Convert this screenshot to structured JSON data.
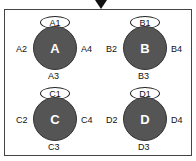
{
  "diagram": {
    "arrow": {
      "direction": "down",
      "color": "#111111"
    },
    "frame_color": "#444444",
    "circle_fill": "#555555",
    "nodes": [
      {
        "id": "A",
        "label": "A",
        "top": "A1",
        "left": "A2",
        "bottom": "A3",
        "right": "A4"
      },
      {
        "id": "B",
        "label": "B",
        "top": "B1",
        "left": "B2",
        "bottom": "B3",
        "right": "B4"
      },
      {
        "id": "C",
        "label": "C",
        "top": "C1",
        "left": "C2",
        "bottom": "C3",
        "right": "C4"
      },
      {
        "id": "D",
        "label": "D",
        "top": "D1",
        "left": "D2",
        "bottom": "D3",
        "right": "D4"
      }
    ]
  }
}
